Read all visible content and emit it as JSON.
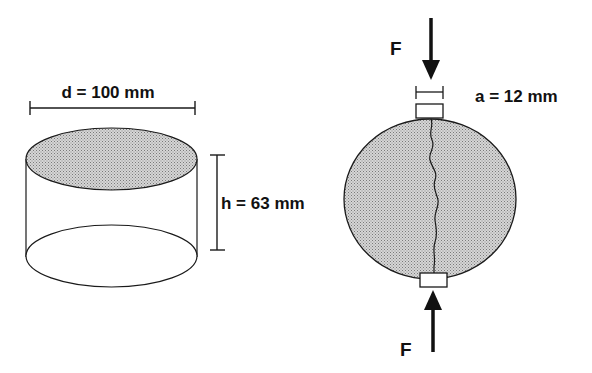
{
  "figure": {
    "cylinder": {
      "diameter_label": "d = 100 mm",
      "height_label": "h = 63 mm"
    },
    "disc": {
      "force_top_label": "F",
      "force_bottom_label": "F",
      "pad_width_label": "a = 12 mm"
    },
    "colors": {
      "stroke": "#1a1a1a",
      "fill_stipple": "#c8c8c8",
      "background": "#ffffff"
    }
  }
}
